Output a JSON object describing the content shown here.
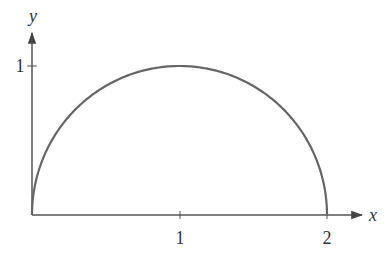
{
  "chart_data": {
    "type": "line",
    "title": "",
    "xlabel": "x",
    "ylabel": "y",
    "xlim": [
      0,
      2.3
    ],
    "ylim": [
      0,
      1.2
    ],
    "x_ticks": [
      "1",
      "2"
    ],
    "y_ticks": [
      "1"
    ],
    "grid": false,
    "legend": null,
    "series": [
      {
        "name": "semicircle y = sqrt(2x - x^2)",
        "x": [
          0,
          0.05,
          0.1,
          0.2,
          0.3,
          0.4,
          0.5,
          0.6,
          0.7,
          0.8,
          0.9,
          1.0,
          1.1,
          1.2,
          1.3,
          1.4,
          1.5,
          1.6,
          1.7,
          1.8,
          1.9,
          1.95,
          2.0
        ],
        "y": [
          0,
          0.312,
          0.436,
          0.6,
          0.714,
          0.8,
          0.866,
          0.917,
          0.954,
          0.98,
          0.995,
          1.0,
          0.995,
          0.98,
          0.954,
          0.917,
          0.866,
          0.8,
          0.714,
          0.6,
          0.436,
          0.312,
          0
        ]
      }
    ]
  },
  "axes": {
    "x_label": "x",
    "y_label": "y",
    "x_tick_labels": [
      "1",
      "2"
    ],
    "y_tick_labels": [
      "1"
    ]
  },
  "colors": {
    "curve": "#666666",
    "axis": "#444444",
    "text": "#333333"
  }
}
